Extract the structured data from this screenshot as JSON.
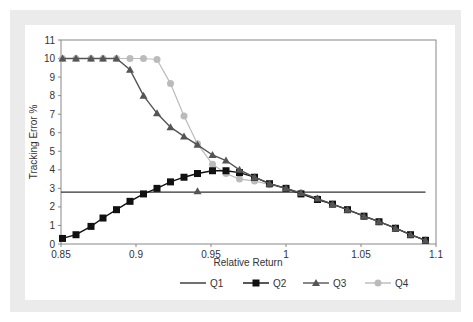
{
  "chart_data": {
    "type": "line",
    "title": "",
    "xlabel": "Relative Return",
    "ylabel": "Tracking Error %",
    "xlim": [
      0.85,
      1.1
    ],
    "ylim": [
      0,
      11
    ],
    "xticks": [
      "0.85",
      "0.9",
      "0.95",
      "1",
      "1.05",
      "1.1"
    ],
    "yticks": [
      "0",
      "1",
      "2",
      "3",
      "4",
      "5",
      "6",
      "7",
      "8",
      "9",
      "10",
      "11"
    ],
    "grid": false,
    "legend_position": "bottom",
    "series": [
      {
        "name": "Q1",
        "marker": "none",
        "color": "#333333",
        "x": [
          0.85,
          1.093
        ],
        "y": [
          2.8,
          2.8
        ]
      },
      {
        "name": "Q2",
        "marker": "square",
        "color": "#111111",
        "x": [
          0.851,
          0.86,
          0.87,
          0.878,
          0.887,
          0.896,
          0.905,
          0.914,
          0.923,
          0.932,
          0.941,
          0.951,
          0.96,
          0.969,
          0.979,
          0.989,
          1.0,
          1.01,
          1.021,
          1.031,
          1.041,
          1.052,
          1.062,
          1.073,
          1.083,
          1.093
        ],
        "y": [
          0.3,
          0.5,
          0.95,
          1.4,
          1.85,
          2.3,
          2.7,
          3.0,
          3.35,
          3.6,
          3.8,
          3.95,
          3.95,
          3.85,
          3.6,
          3.25,
          3.0,
          2.7,
          2.4,
          2.15,
          1.85,
          1.5,
          1.2,
          0.85,
          0.5,
          0.2
        ]
      },
      {
        "name": "Q3",
        "marker": "triangle",
        "color": "#555555",
        "x": [
          0.851,
          0.86,
          0.87,
          0.878,
          0.887,
          0.896,
          0.905,
          0.914,
          0.923,
          0.932,
          0.941,
          0.951,
          0.96,
          0.969,
          0.979,
          0.989,
          1.0,
          1.01,
          1.021,
          1.031,
          1.041,
          1.052,
          1.062,
          1.073,
          1.083,
          1.093
        ],
        "y": [
          10.0,
          10.0,
          10.0,
          10.0,
          10.0,
          9.4,
          8.0,
          7.05,
          6.3,
          5.8,
          5.35,
          4.8,
          4.5,
          4.0,
          3.6,
          3.25,
          3.0,
          2.75,
          2.45,
          2.15,
          1.85,
          1.5,
          1.2,
          0.85,
          0.5,
          0.2
        ],
        "extra_points": [
          {
            "x": 0.941,
            "y": 2.85
          }
        ]
      },
      {
        "name": "Q4",
        "marker": "circle",
        "color": "#bbbbbb",
        "x": [
          0.851,
          0.86,
          0.87,
          0.878,
          0.887,
          0.896,
          0.905,
          0.914,
          0.923,
          0.932,
          0.941,
          0.951,
          0.96,
          0.969,
          0.979,
          0.989,
          1.0,
          1.01,
          1.021,
          1.031,
          1.041,
          1.052,
          1.062,
          1.073,
          1.083,
          1.093
        ],
        "y": [
          10.0,
          10.0,
          10.0,
          10.0,
          10.0,
          10.0,
          10.0,
          9.95,
          8.65,
          6.9,
          5.4,
          4.3,
          3.8,
          3.5,
          3.4,
          3.2,
          3.0,
          2.75,
          2.45,
          2.15,
          1.85,
          1.5,
          1.2,
          0.85,
          0.5,
          0.2
        ]
      }
    ]
  },
  "legend": {
    "items": [
      {
        "label": "Q1"
      },
      {
        "label": "Q2"
      },
      {
        "label": "Q3"
      },
      {
        "label": "Q4"
      }
    ]
  },
  "axes": {
    "x_title": "Relative Return",
    "y_title": "Tracking Error %"
  }
}
